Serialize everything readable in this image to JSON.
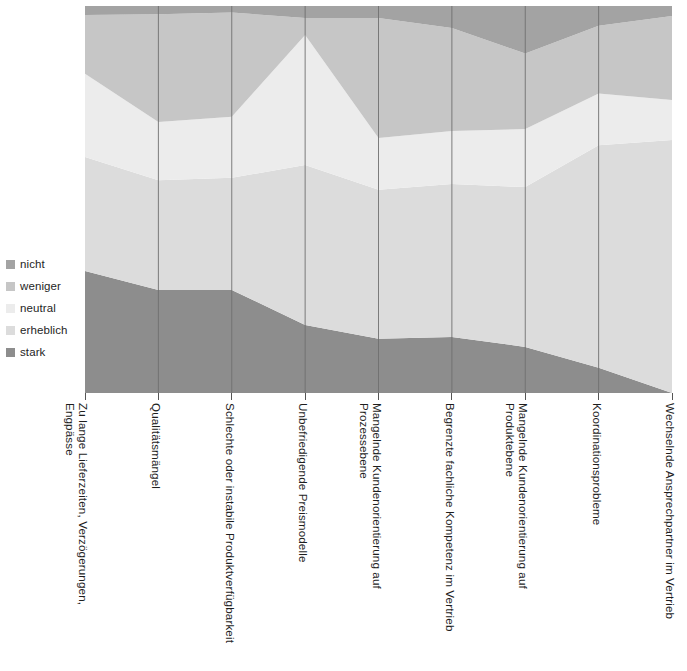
{
  "legend": {
    "position": "left",
    "items": [
      {
        "label": "nicht",
        "color": "#a3a3a3",
        "name": "legend-item-nicht"
      },
      {
        "label": "weniger",
        "color": "#c6c6c6",
        "name": "legend-item-weniger"
      },
      {
        "label": "neutral",
        "color": "#ececec",
        "name": "legend-item-neutral"
      },
      {
        "label": "erheblich",
        "color": "#dcdcdc",
        "name": "legend-item-erheblich"
      },
      {
        "label": "stark",
        "color": "#8d8d8d",
        "name": "legend-item-stark"
      }
    ]
  },
  "chart_data": {
    "type": "area",
    "stacked": true,
    "normalized": true,
    "title": "",
    "subtitle": "",
    "xlabel": "",
    "ylabel": "",
    "ylim": [
      0,
      100
    ],
    "grid": "vertical-category-lines",
    "legend_position": "left",
    "categories": [
      "Zu lange Lieferzeiten, Verzögerungen, Engpässe",
      "Qualitätsmängel",
      "Schlechte oder instabile Produktverfügbarkeit",
      "Unbefriedigende Preismodelle",
      "Mangelnde Kundenorientierung auf Prozessebene",
      "Begrenzte fachliche Kompetenz im Vertrieb",
      "Mangelnde Kundenorientierung auf Produktebene",
      "Koordinationsprobleme",
      "Wechselnde Ansprechpartner im Vertrieb"
    ],
    "series": [
      {
        "name": "stark",
        "color": "#8d8d8d",
        "values": [
          31.5,
          26.6,
          26.6,
          17.6,
          14.0,
          14.5,
          11.9,
          6.5,
          0.0
        ]
      },
      {
        "name": "erheblich",
        "color": "#dcdcdc",
        "values": [
          29.5,
          28.4,
          29.0,
          41.3,
          38.5,
          39.5,
          41.3,
          57.5,
          65.4
        ]
      },
      {
        "name": "neutral",
        "color": "#ececec",
        "values": [
          21.5,
          15.0,
          15.8,
          33.6,
          13.4,
          13.7,
          15.0,
          13.4,
          10.3
        ]
      },
      {
        "name": "weniger",
        "color": "#c6c6c6",
        "values": [
          15.2,
          27.9,
          26.9,
          4.4,
          31.0,
          26.6,
          19.5,
          17.5,
          21.7
        ]
      },
      {
        "name": "nicht",
        "color": "#a3a3a3",
        "values": [
          2.3,
          2.1,
          1.7,
          3.1,
          3.1,
          5.7,
          12.3,
          5.1,
          2.6
        ]
      }
    ],
    "axis": {
      "x_tick_count": 9,
      "y_min": 0,
      "y_max": 100
    }
  }
}
